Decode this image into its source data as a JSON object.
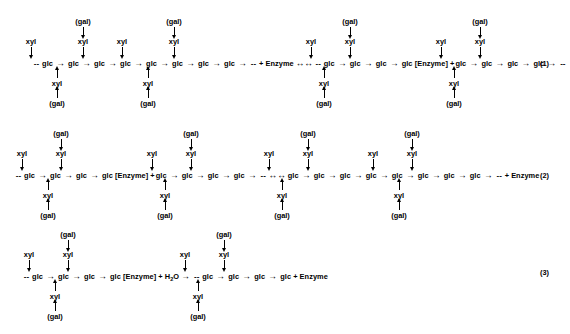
{
  "figure": {
    "type": "reaction-scheme",
    "glyphs": {
      "glc": "glc",
      "xyl": "xyl",
      "gal": "(gal)",
      "enzyme": "Enzyme",
      "enzyme_bracket": "[Enzyme]",
      "water": "H",
      "water_sub": "2",
      "water_tail": "O",
      "plus": "+",
      "arrow_right": "→",
      "arrow_double": "↔",
      "chain_end": "--"
    }
  },
  "rows": [
    {
      "id": "reaction-1",
      "number": "(1)",
      "chain": [
        {
          "t": "dash",
          "text": "--"
        },
        {
          "t": "glc",
          "text": "glc"
        },
        {
          "t": "arrow",
          "text": "→"
        },
        {
          "t": "glc",
          "text": "glc"
        },
        {
          "t": "arrow",
          "text": "→"
        },
        {
          "t": "glc",
          "text": "glc"
        },
        {
          "t": "arrow",
          "text": "→"
        },
        {
          "t": "glc",
          "text": "glc"
        },
        {
          "t": "arrow",
          "text": "→"
        },
        {
          "t": "glc",
          "text": "glc"
        },
        {
          "t": "arrow",
          "text": "→"
        },
        {
          "t": "glc",
          "text": "glc"
        },
        {
          "t": "arrow",
          "text": "→"
        },
        {
          "t": "glc",
          "text": "glc"
        },
        {
          "t": "arrow",
          "text": "→"
        },
        {
          "t": "glc",
          "text": "glc"
        },
        {
          "t": "arrow",
          "text": "→"
        },
        {
          "t": "dash",
          "text": "--"
        },
        {
          "t": "term",
          "text": "+ Enzyme"
        },
        {
          "t": "dbl",
          "text": "↔↔"
        },
        {
          "t": "dash",
          "text": "--"
        },
        {
          "t": "glc",
          "text": "glc"
        },
        {
          "t": "arrow",
          "text": "→"
        },
        {
          "t": "glc",
          "text": "glc"
        },
        {
          "t": "arrow",
          "text": "→"
        },
        {
          "t": "glc",
          "text": "glc"
        },
        {
          "t": "arrow",
          "text": "→"
        },
        {
          "t": "enzbr",
          "text": "glc [Enzyme]  +"
        },
        {
          "t": "glc",
          "text": "glc"
        },
        {
          "t": "arrow",
          "text": "→"
        },
        {
          "t": "glc",
          "text": "glc"
        },
        {
          "t": "arrow",
          "text": "→"
        },
        {
          "t": "glc",
          "text": "glc"
        },
        {
          "t": "arrow",
          "text": "→"
        },
        {
          "t": "glc",
          "text": "glc"
        },
        {
          "t": "arrow",
          "text": "→"
        },
        {
          "t": "dash",
          "text": "--"
        }
      ],
      "above": [
        {
          "x": 31,
          "labels": [
            "xyl"
          ]
        },
        {
          "x": 83,
          "labels": [
            "(gal)",
            "xyl"
          ]
        },
        {
          "x": 122,
          "labels": [
            "xyl"
          ]
        },
        {
          "x": 174,
          "labels": [
            "(gal)",
            "xyl"
          ]
        },
        {
          "x": 311,
          "labels": [
            "xyl"
          ]
        },
        {
          "x": 350,
          "labels": [
            "(gal)",
            "xyl"
          ]
        },
        {
          "x": 441,
          "labels": [
            "xyl"
          ]
        },
        {
          "x": 480,
          "labels": [
            "(gal)",
            "xyl"
          ]
        }
      ],
      "below": [
        {
          "x": 57,
          "labels": [
            "xyl",
            "(gal)"
          ]
        },
        {
          "x": 148,
          "labels": [
            "xyl",
            "(gal)"
          ]
        },
        {
          "x": 324,
          "labels": [
            "xyl",
            "(gal)"
          ]
        },
        {
          "x": 454,
          "labels": [
            "xyl",
            "(gal)"
          ]
        }
      ]
    },
    {
      "id": "reaction-2",
      "number": "(2)",
      "chain": [
        {
          "t": "dash",
          "text": "--"
        },
        {
          "t": "glc",
          "text": "glc"
        },
        {
          "t": "arrow",
          "text": "→"
        },
        {
          "t": "glc",
          "text": "glc"
        },
        {
          "t": "arrow",
          "text": "→"
        },
        {
          "t": "glc",
          "text": "glc"
        },
        {
          "t": "arrow",
          "text": "→"
        },
        {
          "t": "enzbr",
          "text": "glc [Enzyme]  +"
        },
        {
          "t": "glc",
          "text": "glc"
        },
        {
          "t": "arrow",
          "text": "→"
        },
        {
          "t": "glc",
          "text": "glc"
        },
        {
          "t": "arrow",
          "text": "→"
        },
        {
          "t": "glc",
          "text": "glc"
        },
        {
          "t": "arrow",
          "text": "→"
        },
        {
          "t": "glc",
          "text": "glc"
        },
        {
          "t": "arrow",
          "text": "→"
        },
        {
          "t": "dash",
          "text": "--"
        },
        {
          "t": "dbl",
          "text": "↔↔"
        },
        {
          "t": "glc",
          "text": "glc"
        },
        {
          "t": "arrow",
          "text": "→"
        },
        {
          "t": "glc",
          "text": "glc"
        },
        {
          "t": "arrow",
          "text": "→"
        },
        {
          "t": "glc",
          "text": "glc"
        },
        {
          "t": "arrow",
          "text": "→"
        },
        {
          "t": "glc",
          "text": "glc"
        },
        {
          "t": "arrow",
          "text": "→"
        },
        {
          "t": "glc",
          "text": "glc"
        },
        {
          "t": "arrow",
          "text": "→"
        },
        {
          "t": "glc",
          "text": "glc"
        },
        {
          "t": "arrow",
          "text": "→"
        },
        {
          "t": "glc",
          "text": "glc"
        },
        {
          "t": "arrow",
          "text": "→"
        },
        {
          "t": "glc",
          "text": "glc"
        },
        {
          "t": "arrow",
          "text": "→"
        },
        {
          "t": "dash",
          "text": "--"
        },
        {
          "t": "term",
          "text": "+ Enzyme"
        }
      ],
      "above": [
        {
          "x": 22,
          "labels": [
            "xyl"
          ]
        },
        {
          "x": 61,
          "labels": [
            "(gal)",
            "xyl"
          ]
        },
        {
          "x": 152,
          "labels": [
            "xyl"
          ]
        },
        {
          "x": 191,
          "labels": [
            "(gal)",
            "xyl"
          ]
        },
        {
          "x": 269,
          "labels": [
            "xyl"
          ]
        },
        {
          "x": 308,
          "labels": [
            "(gal)",
            "xyl"
          ]
        },
        {
          "x": 373,
          "labels": [
            "xyl"
          ]
        },
        {
          "x": 412,
          "labels": [
            "(gal)",
            "xyl"
          ]
        }
      ],
      "below": [
        {
          "x": 48,
          "labels": [
            "xyl",
            "(gal)"
          ]
        },
        {
          "x": 165,
          "labels": [
            "xyl",
            "(gal)"
          ]
        },
        {
          "x": 282,
          "labels": [
            "xyl",
            "(gal)"
          ]
        },
        {
          "x": 399,
          "labels": [
            "xyl",
            "(gal)"
          ]
        }
      ]
    },
    {
      "id": "reaction-3",
      "number": "(3)",
      "chain": [
        {
          "t": "dash",
          "text": "--"
        },
        {
          "t": "glc",
          "text": "glc"
        },
        {
          "t": "arrow",
          "text": "→"
        },
        {
          "t": "glc",
          "text": "glc"
        },
        {
          "t": "arrow",
          "text": "→"
        },
        {
          "t": "glc",
          "text": "glc"
        },
        {
          "t": "arrow",
          "text": "→"
        },
        {
          "t": "water",
          "text": "glc [Enzyme]  +  H2O"
        },
        {
          "t": "arrow",
          "text": "→"
        },
        {
          "t": "dash",
          "text": "--"
        },
        {
          "t": "glc",
          "text": "glc"
        },
        {
          "t": "arrow",
          "text": "→"
        },
        {
          "t": "glc",
          "text": "glc"
        },
        {
          "t": "arrow",
          "text": "→"
        },
        {
          "t": "glc",
          "text": "glc"
        },
        {
          "t": "arrow",
          "text": "→"
        },
        {
          "t": "glc",
          "text": "glc"
        },
        {
          "t": "term",
          "text": "+ Enzyme"
        }
      ],
      "above": [
        {
          "x": 29,
          "labels": [
            "xyl"
          ]
        },
        {
          "x": 68,
          "labels": [
            "(gal)",
            "xyl"
          ]
        },
        {
          "x": 185,
          "labels": [
            "xyl"
          ]
        },
        {
          "x": 224,
          "labels": [
            "(gal)",
            "xyl"
          ]
        }
      ],
      "below": [
        {
          "x": 55,
          "labels": [
            "xyl",
            "(gal)"
          ]
        },
        {
          "x": 198,
          "labels": [
            "xyl",
            "(gal)"
          ]
        }
      ]
    }
  ],
  "layout": {
    "row_baselines": [
      64,
      176,
      277
    ],
    "eq_numbers": [
      {
        "label": "(1)",
        "x": 540,
        "y": 59
      },
      {
        "label": "(2)",
        "x": 540,
        "y": 171
      },
      {
        "label": "(3)",
        "x": 540,
        "y": 268
      }
    ],
    "chain_left": [
      32,
      14,
      22
    ],
    "colors": {
      "ink": "#000000",
      "background": "#ffffff"
    }
  }
}
